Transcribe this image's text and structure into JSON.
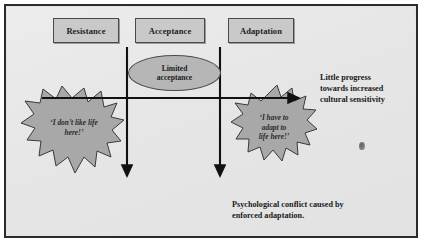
{
  "figure": {
    "frame_color": "#2b2b2b",
    "panel_color": "#e8e8e8",
    "shape_fill": "#a8a8a8",
    "box_fill": "#c9c9c9",
    "ellipse_fill": "#b6b6b6",
    "line_color": "#111111"
  },
  "stages": [
    {
      "id": "resistance",
      "label": "Resistance"
    },
    {
      "id": "acceptance",
      "label": "Acceptance"
    },
    {
      "id": "adaptation",
      "label": "Adaptation"
    }
  ],
  "ellipse": {
    "line1": "Limited",
    "line2": "acceptance"
  },
  "bursts": [
    {
      "id": "burst-left",
      "line1": "‘I don’t like life",
      "line2": "here!’"
    },
    {
      "id": "burst-right",
      "line1": "‘I have to",
      "line2": "adapt to",
      "line3": "life here!’"
    }
  ],
  "captions": {
    "progress": {
      "line1": "Little progress",
      "line2": "towards increased",
      "line3": "cultural sensitivity"
    },
    "conflict": {
      "line1": "Psychological conflict caused by",
      "line2": "enforced adaptation."
    }
  },
  "arrows": {
    "horizontal": {
      "label": "progress-axis-arrow",
      "direction": "right"
    },
    "vertical_1": {
      "label": "resistance-downward-arrow",
      "direction": "down"
    },
    "vertical_2": {
      "label": "adaptation-downward-arrow",
      "direction": "down"
    }
  }
}
